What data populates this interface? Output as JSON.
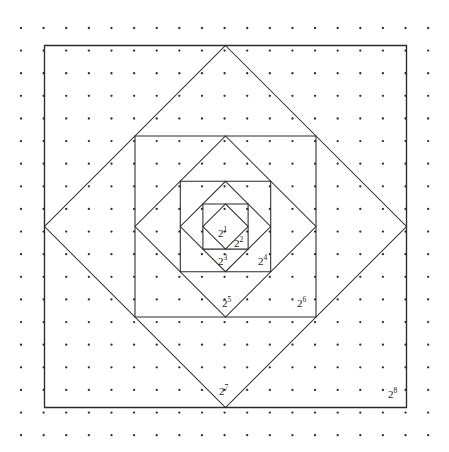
{
  "figure": {
    "background_color": "#ffffff",
    "line_color": "#2a2a2a",
    "dot_color": "#2b2b2b",
    "caption": "",
    "grid": {
      "columns": 19,
      "rows": 19,
      "spacing": 22.62,
      "origin_x": 21,
      "origin_y": 28,
      "dot_radius": 1.15
    },
    "labels": [
      {
        "text": "2",
        "exponent": "1",
        "x": 218,
        "y": 228
      },
      {
        "text": "2",
        "exponent": "2",
        "x": 234,
        "y": 238
      },
      {
        "text": "2",
        "exponent": "3",
        "x": 218,
        "y": 256
      },
      {
        "text": "2",
        "exponent": "4",
        "x": 258,
        "y": 256
      },
      {
        "text": "2",
        "exponent": "5",
        "x": 222,
        "y": 298
      },
      {
        "text": "2",
        "exponent": "6",
        "x": 297,
        "y": 298
      },
      {
        "text": "2",
        "exponent": "7",
        "x": 219,
        "y": 386
      },
      {
        "text": "2",
        "exponent": "8",
        "x": 388,
        "y": 389
      }
    ]
  },
  "chart_data": {
    "type": "diagram",
    "center": {
      "x": 225.5,
      "y": 226.5
    },
    "labels": [
      "2^1",
      "2^2",
      "2^3",
      "2^4",
      "2^5",
      "2^6",
      "2^7",
      "2^8"
    ],
    "areas_in_lattice_units": [
      1,
      2,
      4,
      8,
      16,
      32,
      64,
      128
    ],
    "shapes": [
      {
        "label": "2^1",
        "orientation": "diamond",
        "half_diagonal": 22.6,
        "points": "225.5,203.9 248.1,226.5 225.5,249.1 202.9,226.5"
      },
      {
        "label": "2^2",
        "orientation": "square",
        "half_side": 22.6,
        "points": "202.9,203.9 248.1,203.9 248.1,249.1 202.9,249.1"
      },
      {
        "label": "2^3",
        "orientation": "diamond",
        "half_diagonal": 45.2,
        "points": "225.5,181.3 270.7,226.5 225.5,271.7 180.3,226.5"
      },
      {
        "label": "2^4",
        "orientation": "square",
        "half_side": 45.2,
        "points": "180.3,181.3 270.7,181.3 270.7,271.7 180.3,271.7"
      },
      {
        "label": "2^5",
        "orientation": "diamond",
        "half_diagonal": 90.5,
        "points": "225.5,136.0 316.0,226.5 225.5,317.0 135.0,226.5"
      },
      {
        "label": "2^6",
        "orientation": "square",
        "half_side": 90.5,
        "points": "135.0,136.0 316.0,136.0 316.0,317.0 135.0,317.0"
      },
      {
        "label": "2^7",
        "orientation": "diamond",
        "half_diagonal": 181.0,
        "points": "225.5,45.5 406.5,226.5 225.5,407.5 44.5,226.5"
      },
      {
        "label": "2^8",
        "orientation": "square",
        "half_side": 181.0,
        "points": "44.5,45.5 406.5,45.5 406.5,407.5 44.5,407.5"
      }
    ]
  }
}
